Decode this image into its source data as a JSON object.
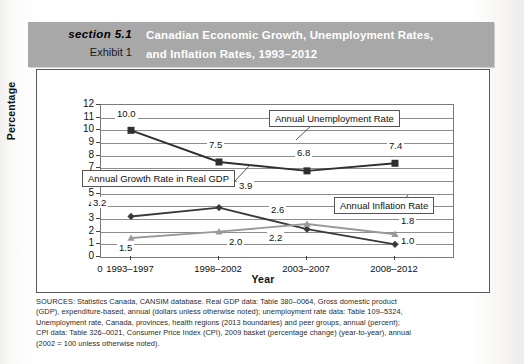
{
  "header": {
    "section_label": "section 5.1",
    "exhibit_label": "Exhibit 1",
    "title_line1": "Canadian Economic Growth, Unemployment Rates,",
    "title_line2": "and Inflation Rates, 1993–2012",
    "band_color": "#a8a8a8",
    "title_color": "#ffffff"
  },
  "chart_data": {
    "type": "line",
    "title": "Canadian Economic Growth, Unemployment Rates, and Inflation Rates, 1993–2012",
    "xlabel": "Year",
    "ylabel": "Percentage",
    "categories": [
      "1993–1997",
      "1998–2002",
      "2003–2007",
      "2008–2012"
    ],
    "origin_tick": "0",
    "ylim": [
      0,
      12
    ],
    "yticks": [
      12,
      11,
      10,
      9,
      8,
      7,
      6,
      5,
      4,
      3,
      2,
      1,
      0
    ],
    "grid": true,
    "legend": "annotations",
    "series": [
      {
        "name": "Annual Unemployment Rate",
        "marker": "square",
        "color": "#2f2f2f",
        "values": [
          10.0,
          7.5,
          6.8,
          7.4
        ],
        "labels": [
          "10.0",
          "7.5",
          "6.8",
          "7.4"
        ]
      },
      {
        "name": "Annual Growth Rate in Real GDP",
        "marker": "diamond",
        "color": "#3a3a3a",
        "values": [
          3.2,
          3.9,
          2.2,
          1.0
        ],
        "labels": [
          "3.2",
          "3.9",
          "2.2",
          "1.0"
        ]
      },
      {
        "name": "Annual Inflation Rate",
        "marker": "triangle",
        "color": "#9a9a9a",
        "values": [
          1.5,
          2.0,
          2.6,
          1.8
        ],
        "labels": [
          "1.5",
          "2.0",
          "2.6",
          "1.8"
        ]
      }
    ],
    "annotations": [
      "Annual Unemployment Rate",
      "Annual Growth Rate in Real GDP",
      "Annual Inflation Rate"
    ]
  },
  "sources": {
    "line1": "SOURCES: Statistics Canada, CANSIM database. Real GDP data: Table 380–0064, Gross domestic product",
    "line2": "(GDP), expenditure-based, annual (dollars unless otherwise noted); unemployment rate data: Table 109–5324,",
    "line3": "Unemployment rate, Canada, provinces, health regions (2013 boundaries) and peer groups, annual (percent);",
    "line4": "CPI data: Table 326–0021, Consumer Price Index (CPI), 2009 basket (percentage change) (year-to-year), annual",
    "line5": "(2002 = 100 unless otherwise noted)."
  }
}
